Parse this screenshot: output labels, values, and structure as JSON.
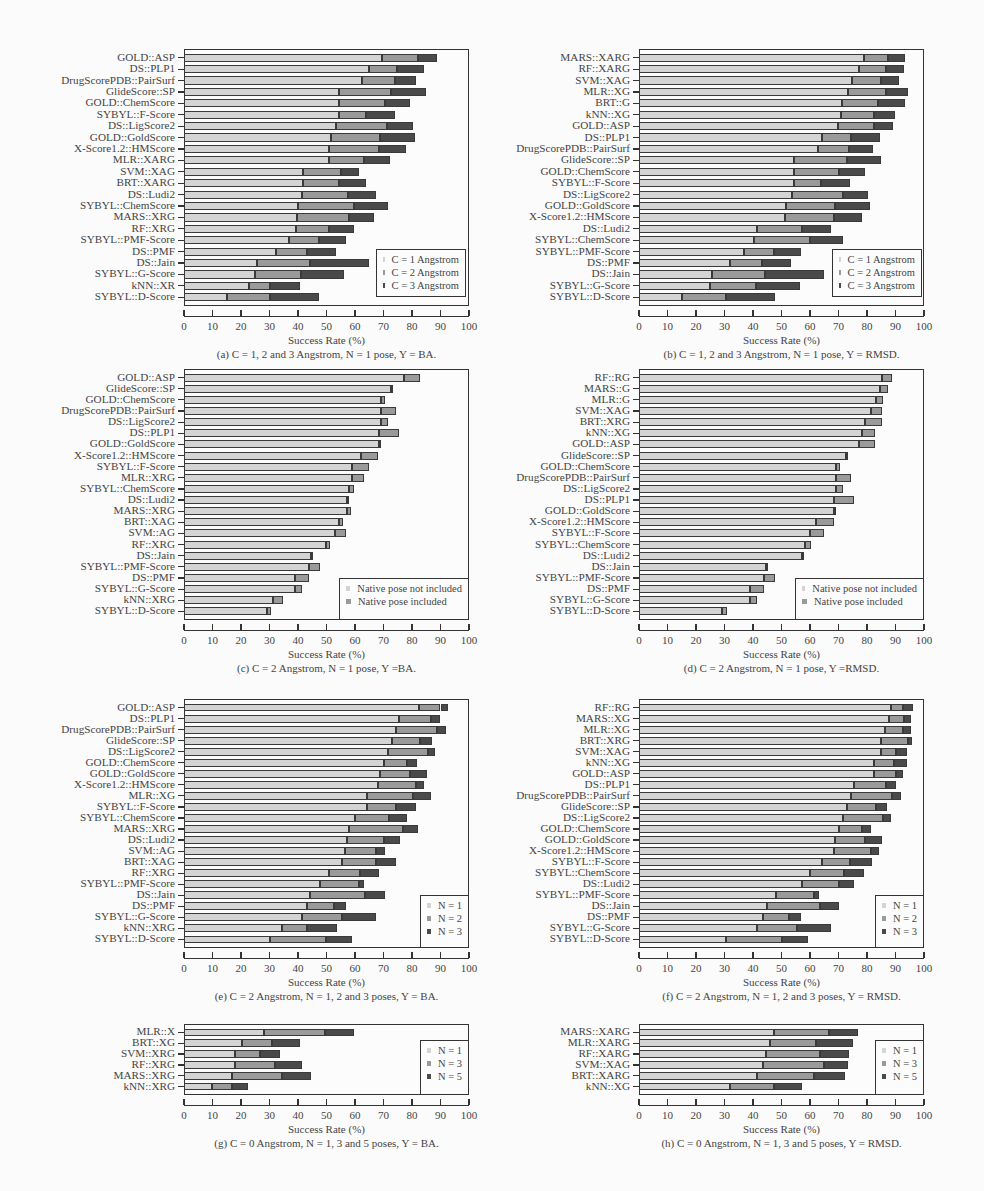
{
  "colors": {
    "s1": "#d4d4d4",
    "s2": "#9a9a9a",
    "s3": "#4a4a4a"
  },
  "chart_data": [
    {
      "id": "a",
      "type": "bar",
      "orientation": "horizontal",
      "stacked": true,
      "caption": "(a) C = 1, 2 and 3 Angstrom, N = 1 pose, Y = BA.",
      "xlabel": "Success Rate (%)",
      "xlim": [
        0,
        100
      ],
      "xticks": [
        0,
        10,
        20,
        30,
        40,
        50,
        60,
        70,
        80,
        90,
        100
      ],
      "legend": [
        "C = 1 Angstrom",
        "C = 2 Angstrom",
        "C = 3 Angstrom"
      ],
      "legend_pos": "bottom-right",
      "categories": [
        "GOLD::ASP",
        "DS::PLP1",
        "DrugScorePDB::PairSurf",
        "GlideScore::SP",
        "GOLD::ChemScore",
        "SYBYL::F-Score",
        "DS::LigScore2",
        "GOLD::GoldScore",
        "X-Score1.2::HMScore",
        "MLR::XARG",
        "SVM::XAG",
        "BRT::XARG",
        "DS::Ludi2",
        "SYBYL::ChemScore",
        "MARS::XRG",
        "RF::XRG",
        "SYBYL::PMF-Score",
        "DS::PMF",
        "DS::Jain",
        "SYBYL::G-Score",
        "kNN::XR",
        "SYBYL::D-Score"
      ],
      "cumulative": [
        [
          69.3,
          82,
          88.7
        ],
        [
          64.8,
          74.8,
          84.3
        ],
        [
          62.5,
          74,
          81.5
        ],
        [
          54.5,
          72.8,
          84.8
        ],
        [
          54.5,
          70.5,
          79.3
        ],
        [
          54.5,
          64,
          74
        ],
        [
          53.5,
          71.3,
          80.5
        ],
        [
          51.5,
          68.8,
          81
        ],
        [
          51,
          68.3,
          78
        ],
        [
          51,
          63,
          72.3
        ],
        [
          41.8,
          55,
          61.3
        ],
        [
          41.8,
          54.5,
          63.8
        ],
        [
          41.3,
          57.5,
          67.5
        ],
        [
          40,
          59.8,
          71.5
        ],
        [
          39.8,
          58,
          66.5
        ],
        [
          39.3,
          50.8,
          59.5
        ],
        [
          36.8,
          47.5,
          56.8
        ],
        [
          32.3,
          43,
          53.5
        ],
        [
          25.5,
          44.3,
          64.8
        ],
        [
          24.8,
          41,
          56.3
        ],
        [
          22.8,
          30.3,
          40.8
        ],
        [
          15,
          30.3,
          47.3
        ]
      ]
    },
    {
      "id": "b",
      "type": "bar",
      "orientation": "horizontal",
      "stacked": true,
      "caption": "(b) C = 1, 2 and 3 Angstrom, N = 1 pose, Y = RMSD.",
      "xlabel": "Success Rate (%)",
      "xlim": [
        0,
        100
      ],
      "xticks": [
        0,
        10,
        20,
        30,
        40,
        50,
        60,
        70,
        80,
        90,
        100
      ],
      "legend": [
        "C = 1 Angstrom",
        "C = 2 Angstrom",
        "C = 3 Angstrom"
      ],
      "legend_pos": "bottom-right",
      "categories": [
        "MARS::XARG",
        "RF::XARG",
        "SVM::XAG",
        "MLR::XG",
        "BRT::G",
        "kNN::XG",
        "GOLD::ASP",
        "DS::PLP1",
        "DrugScorePDB::PairSurf",
        "GlideScore::SP",
        "GOLD::ChemScore",
        "SYBYL::F-Score",
        "DS::LigScore2",
        "GOLD::GoldScore",
        "X-Score1.2::HMScore",
        "DS::Ludi2",
        "SYBYL::ChemScore",
        "SYBYL::PMF-Score",
        "DS::PMF",
        "DS::Jain",
        "SYBYL::G-Score",
        "SYBYL::D-Score"
      ],
      "cumulative": [
        [
          79,
          87.3,
          93.3
        ],
        [
          77.3,
          86.5,
          93
        ],
        [
          74.8,
          85,
          91.3
        ],
        [
          73.5,
          86.5,
          94.3
        ],
        [
          71.3,
          84,
          93.5
        ],
        [
          71,
          82.3,
          89.8
        ],
        [
          69.8,
          82.5,
          89
        ],
        [
          64.3,
          74.5,
          84.5
        ],
        [
          62.8,
          73.8,
          82
        ],
        [
          54.5,
          73,
          84.8
        ],
        [
          54.5,
          70.3,
          79.3
        ],
        [
          54.5,
          64,
          74
        ],
        [
          53.8,
          71.5,
          80.5
        ],
        [
          51.5,
          68.8,
          81
        ],
        [
          51.3,
          68.3,
          78.3
        ],
        [
          41.3,
          57.3,
          67.5
        ],
        [
          40.3,
          60,
          71.5
        ],
        [
          36.8,
          47.3,
          56.8
        ],
        [
          32,
          43.3,
          53.3
        ],
        [
          25.5,
          44.3,
          64.8
        ],
        [
          24.8,
          41,
          56.5
        ],
        [
          15,
          30.5,
          47.8
        ]
      ]
    },
    {
      "id": "c",
      "type": "bar",
      "orientation": "horizontal",
      "stacked": true,
      "caption": "(c) C = 2 Angstrom, N = 1 pose, Y =BA.",
      "xlabel": "Success Rate (%)",
      "xlim": [
        0,
        100
      ],
      "xticks": [
        0,
        10,
        20,
        30,
        40,
        50,
        60,
        70,
        80,
        90,
        100
      ],
      "legend": [
        "Native pose not included",
        "Native pose included"
      ],
      "legend_pos": "bottom-right",
      "categories": [
        "GOLD::ASP",
        "GlideScore::SP",
        "GOLD::ChemScore",
        "DrugScorePDB::PairSurf",
        "DS::LigScore2",
        "DS::PLP1",
        "GOLD::GoldScore",
        "X-Score1.2::HMScore",
        "SYBYL::F-Score",
        "MLR::XRG",
        "SYBYL::ChemScore",
        "DS::Ludi2",
        "MARS::XRG",
        "BRT::XAG",
        "SVM::AG",
        "RF::XRG",
        "DS::Jain",
        "SYBYL::PMF-Score",
        "DS::PMF",
        "SYBYL::G-Score",
        "kNN::XRG",
        "SYBYL::D-Score"
      ],
      "cumulative": [
        [
          77.2,
          82.8
        ],
        [
          72.8,
          73
        ],
        [
          69.2,
          70.5
        ],
        [
          69.2,
          74.3
        ],
        [
          69.2,
          71.5
        ],
        [
          68.3,
          75.3
        ],
        [
          68.3,
          68.8
        ],
        [
          62.2,
          68.2
        ],
        [
          59,
          64.8
        ],
        [
          59,
          63.3
        ],
        [
          58,
          59.8
        ],
        [
          57.2,
          57.5
        ],
        [
          57.2,
          58.5
        ],
        [
          54.5,
          55.8
        ],
        [
          53,
          57
        ],
        [
          49.8,
          51.3
        ],
        [
          44.5,
          44.5
        ],
        [
          44,
          47.8
        ],
        [
          39,
          43.8
        ],
        [
          39,
          41.5
        ],
        [
          31.3,
          34.8
        ],
        [
          29,
          30.5
        ]
      ]
    },
    {
      "id": "d",
      "type": "bar",
      "orientation": "horizontal",
      "stacked": true,
      "caption": "(d) C = 2 Angstrom, N = 1 pose, Y =RMSD.",
      "xlabel": "Success Rate (%)",
      "xlim": [
        0,
        100
      ],
      "xticks": [
        0,
        10,
        20,
        30,
        40,
        50,
        60,
        70,
        80,
        90,
        100
      ],
      "legend": [
        "Native pose not included",
        "Native pose included"
      ],
      "legend_pos": "bottom-right",
      "categories": [
        "RF::RG",
        "MARS::G",
        "MLR::G",
        "SVM::XAG",
        "BRT::XRG",
        "kNN::XG",
        "GOLD::ASP",
        "GlideScore::SP",
        "GOLD::ChemScore",
        "DrugScorePDB::PairSurf",
        "DS::LigScore2",
        "DS::PLP1",
        "GOLD::GoldScore",
        "X-Score1.2::HMScore",
        "SYBYL::F-Score",
        "SYBYL::ChemScore",
        "DS::Ludi2",
        "DS::Jain",
        "SYBYL::PMF-Score",
        "DS::PMF",
        "SYBYL::G-Score",
        "SYBYL::D-Score"
      ],
      "cumulative": [
        [
          85.3,
          88.8
        ],
        [
          84.5,
          87.5
        ],
        [
          83.3,
          85.5
        ],
        [
          81.5,
          85.3
        ],
        [
          79.3,
          85.3
        ],
        [
          78.3,
          82.8
        ],
        [
          77.2,
          82.8
        ],
        [
          72.8,
          73.5
        ],
        [
          69.2,
          70.5
        ],
        [
          69.2,
          74.3
        ],
        [
          69.2,
          71.5
        ],
        [
          68.3,
          75.3
        ],
        [
          68.3,
          68.8
        ],
        [
          62.2,
          68.5
        ],
        [
          60,
          64.8
        ],
        [
          58.3,
          60.2
        ],
        [
          57.2,
          57.5
        ],
        [
          44.5,
          44.8
        ],
        [
          44,
          47.8
        ],
        [
          39,
          43.8
        ],
        [
          39,
          41.5
        ],
        [
          29,
          30.8
        ]
      ]
    },
    {
      "id": "e",
      "type": "bar",
      "orientation": "horizontal",
      "stacked": true,
      "caption": "(e) C = 2 Angstrom, N = 1, 2 and 3 poses, Y = BA.",
      "xlabel": "Success Rate (%)",
      "xlim": [
        0,
        100
      ],
      "xticks": [
        0,
        10,
        20,
        30,
        40,
        50,
        60,
        70,
        80,
        90,
        100
      ],
      "legend": [
        "N = 1",
        "N = 2",
        "N = 3"
      ],
      "legend_pos": "bottom-right",
      "categories": [
        "GOLD::ASP",
        "DS::PLP1",
        "DrugScorePDB::PairSurf",
        "GlideScore::SP",
        "DS::LigScore2",
        "GOLD::ChemScore",
        "GOLD::GoldScore",
        "X-Score1.2::HMScore",
        "MLR::XG",
        "SYBYL::F-Score",
        "SYBYL::ChemScore",
        "MARS::XRG",
        "DS::Ludi2",
        "SVM::AG",
        "BRT::XAG",
        "RF::XRG",
        "SYBYL::PMF-Score",
        "DS::Jain",
        "DS::PMF",
        "SYBYL::G-Score",
        "kNN::XRG",
        "SYBYL::D-Score"
      ],
      "cumulative": [
        [
          82.3,
          90,
          92.5
        ],
        [
          75.3,
          86.5,
          90
        ],
        [
          74.3,
          88.8,
          91.8
        ],
        [
          73,
          82.8,
          87
        ],
        [
          71.5,
          85.5,
          88
        ],
        [
          70.3,
          78.3,
          81.8
        ],
        [
          68.8,
          79.3,
          85.3
        ],
        [
          68,
          81.5,
          84.3
        ],
        [
          64.3,
          80.3,
          86.8
        ],
        [
          64.3,
          74.3,
          81.3
        ],
        [
          60,
          71.8,
          78.3
        ],
        [
          57.8,
          76.8,
          82
        ],
        [
          57.3,
          70.3,
          75.8
        ],
        [
          56.5,
          67.5,
          70.5
        ],
        [
          55.3,
          67.5,
          74.3
        ],
        [
          50.8,
          61.8,
          68.3
        ],
        [
          47.8,
          61.5,
          63.3
        ],
        [
          44.3,
          63.5,
          70.5
        ],
        [
          43,
          52.8,
          56.8
        ],
        [
          41.3,
          55.3,
          67.3
        ],
        [
          34.5,
          43,
          53.8
        ],
        [
          30.3,
          49.8,
          58.8
        ]
      ]
    },
    {
      "id": "f",
      "type": "bar",
      "orientation": "horizontal",
      "stacked": true,
      "caption": "(f) C = 2 Angstrom, N = 1, 2 and 3 poses, Y = RMSD.",
      "xlabel": "Success Rate (%)",
      "xlim": [
        0,
        100
      ],
      "xticks": [
        0,
        10,
        20,
        30,
        40,
        50,
        60,
        70,
        80,
        90,
        100
      ],
      "legend": [
        "N = 1",
        "N = 2",
        "N = 3"
      ],
      "legend_pos": "bottom-right",
      "categories": [
        "RF::RG",
        "MARS::XG",
        "MLR::XG",
        "BRT::XRG",
        "SVM::XAG",
        "kNN::XG",
        "GOLD::ASP",
        "DS::PLP1",
        "DrugScorePDB::PairSurf",
        "GlideScore::SP",
        "DS::LigScore2",
        "GOLD::ChemScore",
        "GOLD::GoldScore",
        "X-Score1.2::HMScore",
        "SYBYL::F-Score",
        "SYBYL::ChemScore",
        "DS::Ludi2",
        "SYBYL::PMF-Score",
        "DS::Jain",
        "DS::PMF",
        "SYBYL::G-Score",
        "SYBYL::D-Score"
      ],
      "cumulative": [
        [
          88.3,
          92.8,
          96.3
        ],
        [
          87.8,
          93,
          95.5
        ],
        [
          86.3,
          92.8,
          95.5
        ],
        [
          85,
          94.5,
          95.8
        ],
        [
          85,
          90.3,
          94
        ],
        [
          82.5,
          89.3,
          94
        ],
        [
          82.5,
          90,
          92.5
        ],
        [
          75.3,
          86.8,
          90.3
        ],
        [
          74.3,
          88.8,
          91.8
        ],
        [
          73,
          83,
          87
        ],
        [
          71.5,
          85.5,
          88.3
        ],
        [
          70.3,
          78.3,
          81.5
        ],
        [
          68.8,
          79.3,
          85.3
        ],
        [
          68.3,
          81.5,
          84.3
        ],
        [
          64.3,
          74,
          81.8
        ],
        [
          60,
          71.8,
          78.8
        ],
        [
          57.3,
          70.3,
          75.5
        ],
        [
          48,
          61.5,
          63.3
        ],
        [
          44.8,
          63.5,
          70.3
        ],
        [
          43.5,
          52.8,
          56.8
        ],
        [
          41.3,
          55.5,
          67.3
        ],
        [
          30.5,
          50.3,
          59.3
        ]
      ]
    },
    {
      "id": "g",
      "type": "bar",
      "orientation": "horizontal",
      "stacked": true,
      "caption": "(g) C = 0 Angstrom, N = 1, 3 and 5 poses, Y = BA.",
      "xlabel": "Success Rate (%)",
      "xlim": [
        0,
        100
      ],
      "xticks": [
        0,
        10,
        20,
        30,
        40,
        50,
        60,
        70,
        80,
        90,
        100
      ],
      "legend": [
        "N = 1",
        "N = 3",
        "N = 5"
      ],
      "legend_pos": "right",
      "categories": [
        "MLR::X",
        "BRT::XG",
        "SVM::XRG",
        "RF::XRG",
        "MARS::XRG",
        "kNN::XRG"
      ],
      "cumulative": [
        [
          28,
          49.3,
          59.5
        ],
        [
          20.3,
          30.8,
          40.8
        ],
        [
          18,
          26.5,
          33.8
        ],
        [
          18,
          32,
          41.3
        ],
        [
          16.8,
          34.5,
          44.5
        ],
        [
          9.8,
          17,
          22.3
        ]
      ]
    },
    {
      "id": "h",
      "type": "bar",
      "orientation": "horizontal",
      "stacked": true,
      "caption": "(h) C = 0 Angstrom, N = 1, 3 and 5 poses, Y = RMSD.",
      "xlabel": "Success Rate (%)",
      "xlim": [
        0,
        100
      ],
      "xticks": [
        0,
        10,
        20,
        30,
        40,
        50,
        60,
        70,
        80,
        90,
        100
      ],
      "legend": [
        "N = 1",
        "N = 3",
        "N = 5"
      ],
      "legend_pos": "right",
      "categories": [
        "MARS::XARG",
        "MLR::XARG",
        "RF::XARG",
        "SVM::XAG",
        "BRT::XARG",
        "kNN::XG"
      ],
      "cumulative": [
        [
          47.3,
          66.8,
          77
        ],
        [
          45.8,
          62,
          75
        ],
        [
          44.5,
          63.5,
          73.8
        ],
        [
          43.5,
          65,
          73.5
        ],
        [
          41.5,
          61.5,
          72.3
        ],
        [
          31.8,
          47.5,
          57.3
        ]
      ]
    }
  ]
}
